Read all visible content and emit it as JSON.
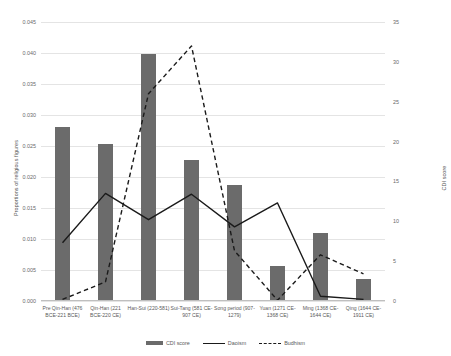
{
  "chart_data": {
    "type": "bar",
    "title": "",
    "xlabel": "",
    "ylabel": "Proportions of religious figures",
    "y2label": "CDI score",
    "grid": true,
    "legend_position": "bottom",
    "ylim": [
      0,
      0.045
    ],
    "y2lim": [
      0,
      35
    ],
    "yticks": [
      "0.000",
      "0.005",
      "0.010",
      "0.015",
      "0.020",
      "0.025",
      "0.030",
      "0.035",
      "0.040",
      "0.045"
    ],
    "ytick_values": [
      0,
      0.005,
      0.01,
      0.015,
      0.02,
      0.025,
      0.03,
      0.035,
      0.04,
      0.045
    ],
    "y2ticks": [
      "0",
      "5",
      "10",
      "15",
      "20",
      "25",
      "30",
      "35"
    ],
    "y2tick_values": [
      0,
      5,
      10,
      15,
      20,
      25,
      30,
      35
    ],
    "categories": [
      "Pre Qin-Han (476 BCE-221 BCE)",
      "Qin-Han (221 BCE-220 CE)",
      "Han-Sui (220-581)",
      "Sui-Tang (581 CE-907 CE)",
      "Song period (907-1279)",
      "Yuan (1271 CE-1368 CE)",
      "Ming (1368 CE-1644 CE)",
      "Qing (1644 CE-1911 CE)"
    ],
    "series": [
      {
        "name": "CDI score",
        "type": "bar",
        "axis": "right",
        "color": "#6b6b6b",
        "values": [
          0.028,
          0.0254,
          0.0399,
          0.0227,
          0.0187,
          0.0057,
          0.0109,
          0.0036
        ]
      },
      {
        "name": "Daoism",
        "type": "line",
        "style": "solid",
        "axis": "right",
        "color": "#1a1a1a",
        "values": [
          7.3,
          13.5,
          10.2,
          13.4,
          9.3,
          12.3,
          0.6,
          0.2
        ]
      },
      {
        "name": "Budhism",
        "type": "line",
        "style": "dashed",
        "axis": "right",
        "color": "#1a1a1a",
        "values": [
          0.2,
          2.4,
          26.0,
          32.0,
          6.3,
          0.1,
          5.8,
          3.4
        ]
      }
    ]
  }
}
